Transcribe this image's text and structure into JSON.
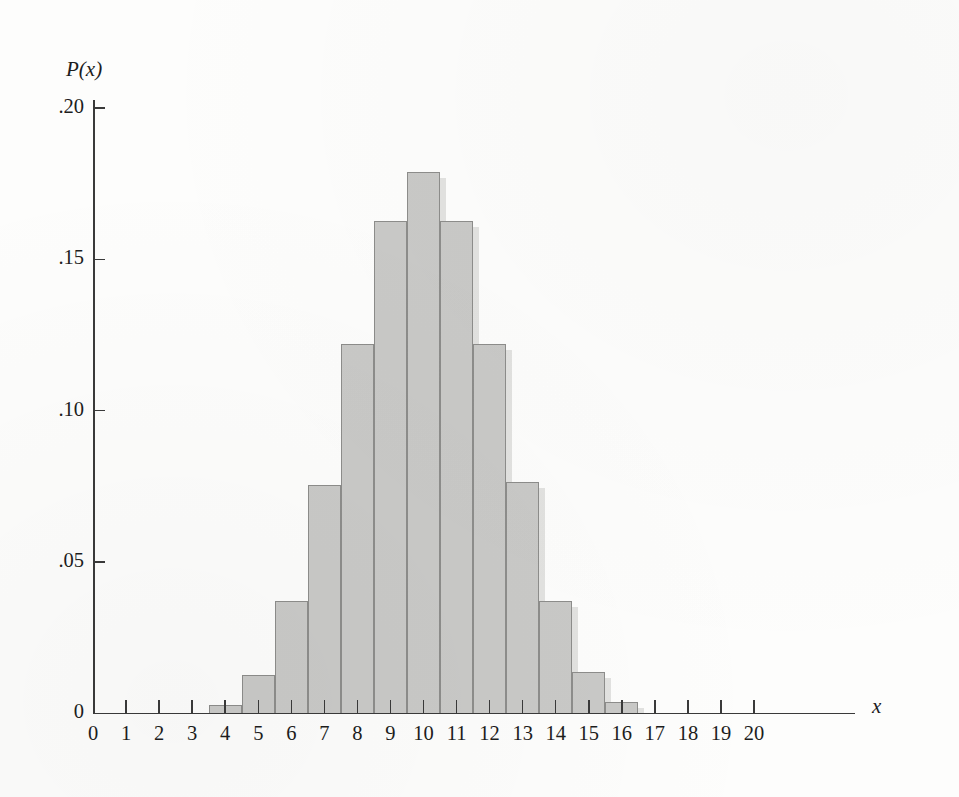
{
  "figure": {
    "y_axis_name": "P(x)",
    "x_axis_name": "x"
  },
  "chart_data": {
    "type": "bar",
    "title": "",
    "subtitle": "",
    "xlabel": "x",
    "ylabel": "P(x)",
    "xlim": [
      0,
      20
    ],
    "ylim": [
      0,
      0.2
    ],
    "grid": false,
    "legend": null,
    "annotations": [],
    "y_ticks": [
      0,
      0.05,
      0.1,
      0.15,
      0.2
    ],
    "y_tick_labels": [
      "0",
      ".05",
      ".10",
      ".15",
      ".20"
    ],
    "categories": [
      0,
      1,
      2,
      3,
      4,
      5,
      6,
      7,
      8,
      9,
      10,
      11,
      12,
      13,
      14,
      15,
      16,
      17,
      18,
      19,
      20
    ],
    "x_tick_labels": [
      "0",
      "1",
      "2",
      "3",
      "4",
      "5",
      "6",
      "7",
      "8",
      "9",
      "10",
      "11",
      "12",
      "13",
      "14",
      "15",
      "16",
      "17",
      "18",
      "19",
      "20"
    ],
    "values": [
      0.0,
      0.0,
      0.0,
      0.0,
      0.0025,
      0.0125,
      0.037,
      0.0755,
      0.122,
      0.1625,
      0.179,
      0.1625,
      0.122,
      0.0765,
      0.037,
      0.0135,
      0.0035,
      0.0,
      0.0,
      0.0,
      0.0
    ],
    "bar_color": "#c9c9c7",
    "bar_edge_color": "#8d8d8b",
    "bar_shadow_color": "#e2e2e0"
  }
}
